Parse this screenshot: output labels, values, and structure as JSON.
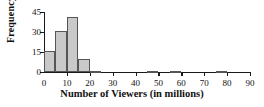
{
  "chart_data": {
    "type": "bar",
    "title": "",
    "xlabel": "Number of Viewers (in millions)",
    "ylabel": "Frequency",
    "xlim": [
      0,
      90
    ],
    "ylim": [
      0,
      45
    ],
    "grid": false,
    "legend": null,
    "bin_width": 5,
    "xticks": [
      0,
      10,
      20,
      30,
      40,
      50,
      60,
      70,
      80,
      90
    ],
    "yticks": [
      0,
      15,
      30,
      45
    ],
    "bins": [
      {
        "start": 0,
        "end": 5,
        "value": 16
      },
      {
        "start": 5,
        "end": 10,
        "value": 31
      },
      {
        "start": 10,
        "end": 15,
        "value": 41
      },
      {
        "start": 15,
        "end": 20,
        "value": 10
      },
      {
        "start": 20,
        "end": 25,
        "value": 1
      },
      {
        "start": 25,
        "end": 30,
        "value": 0
      },
      {
        "start": 30,
        "end": 35,
        "value": 0
      },
      {
        "start": 35,
        "end": 40,
        "value": 0
      },
      {
        "start": 40,
        "end": 45,
        "value": 0
      },
      {
        "start": 45,
        "end": 50,
        "value": 1
      },
      {
        "start": 50,
        "end": 55,
        "value": 0
      },
      {
        "start": 55,
        "end": 60,
        "value": 1
      },
      {
        "start": 60,
        "end": 65,
        "value": 0
      },
      {
        "start": 65,
        "end": 70,
        "value": 0
      },
      {
        "start": 70,
        "end": 75,
        "value": 0
      },
      {
        "start": 75,
        "end": 80,
        "value": 1
      },
      {
        "start": 80,
        "end": 85,
        "value": 0
      },
      {
        "start": 85,
        "end": 90,
        "value": 0
      }
    ],
    "colors": {
      "bar_fill": "#c9c9c9",
      "bar_edge": "#555555",
      "axis": "#1a1a1a",
      "text": "#111111",
      "background": "#ffffff"
    }
  }
}
